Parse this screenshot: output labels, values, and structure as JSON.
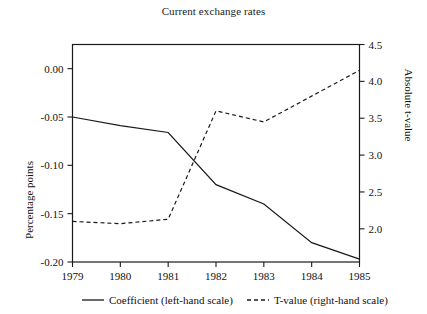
{
  "chart_data": {
    "type": "line",
    "title": "Current exchange rates",
    "xlabel": "",
    "ylabel": "Percentage points",
    "y2label": "Absolute t-value",
    "x": [
      1979,
      1980,
      1981,
      1982,
      1983,
      1984,
      1985
    ],
    "xtick_labels": [
      "1979",
      "1980",
      "1981",
      "1982",
      "1983",
      "1984",
      "1985"
    ],
    "ylim": [
      -0.2,
      0.025
    ],
    "ytick_values": [
      0.0,
      -0.05,
      -0.1,
      -0.15,
      -0.2
    ],
    "ytick_labels": [
      "0.00",
      "-0.05",
      "-0.10",
      "-0.15",
      "-0.20"
    ],
    "y2lim": [
      1.55,
      4.5
    ],
    "y2tick_values": [
      4.5,
      4.0,
      3.5,
      3.0,
      2.5,
      2.0
    ],
    "y2tick_labels": [
      "4.5",
      "4.0",
      "3.5",
      "3.0",
      "2.5",
      "2.0"
    ],
    "grid": false,
    "legend_position": "bottom",
    "series": [
      {
        "name": "Coefficient (left-hand scale)",
        "axis": "left",
        "style": "solid",
        "values": [
          -0.05,
          -0.059,
          -0.066,
          -0.12,
          -0.14,
          -0.18,
          -0.197
        ]
      },
      {
        "name": "T-value (right-hand scale)",
        "axis": "right",
        "style": "dashed",
        "values": [
          2.1,
          2.07,
          2.13,
          3.6,
          3.45,
          3.8,
          4.15
        ]
      }
    ]
  },
  "legend": {
    "items": [
      {
        "label": "Coefficient (left-hand scale)",
        "style": "solid"
      },
      {
        "label": "T-value (right-hand scale)",
        "style": "dashed"
      }
    ]
  }
}
